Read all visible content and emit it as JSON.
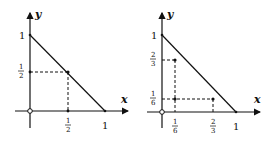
{
  "diagrams": [
    {
      "axes": {
        "x_label": "x",
        "y_label": "y"
      },
      "y_ticks": [
        {
          "num": "1",
          "den": ""
        },
        {
          "num": "1",
          "den": "2"
        }
      ],
      "x_ticks": [
        {
          "num": "1",
          "den": "2"
        },
        {
          "num": "1",
          "den": ""
        }
      ],
      "line": "segment from (0,1) to (1,0)",
      "points": [
        {
          "x": "1/2",
          "y": "1/2"
        }
      ],
      "origin_marker": "open circle"
    },
    {
      "axes": {
        "x_label": "x",
        "y_label": "y"
      },
      "y_ticks": [
        {
          "num": "1",
          "den": ""
        },
        {
          "num": "2",
          "den": "3"
        },
        {
          "num": "1",
          "den": "6"
        }
      ],
      "x_ticks": [
        {
          "num": "1",
          "den": "6"
        },
        {
          "num": "2",
          "den": "3"
        },
        {
          "num": "1",
          "den": ""
        }
      ],
      "line": "segment from (0,1) to (1,0)",
      "points": [
        {
          "x": "1/6",
          "y": "2/3"
        },
        {
          "x": "2/3",
          "y": "1/6"
        },
        {
          "x": "1/6",
          "y": "1/6"
        }
      ],
      "origin_marker": "open circle"
    }
  ]
}
